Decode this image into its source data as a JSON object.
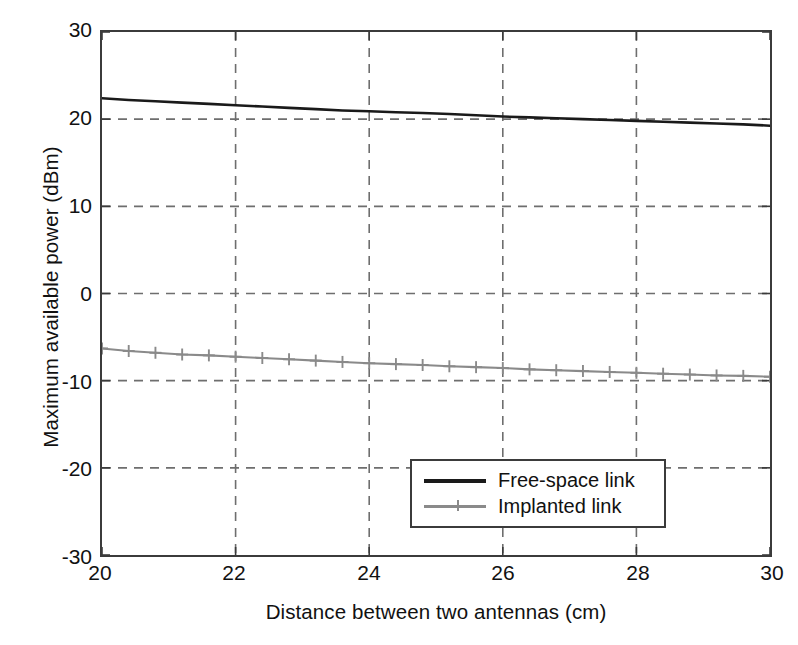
{
  "chart_data": {
    "type": "line",
    "title": "",
    "xlabel": "Distance between two antennas (cm)",
    "ylabel": "Maximum available power (dBm)",
    "xlim": [
      20,
      30
    ],
    "ylim": [
      -30,
      30
    ],
    "xticks": [
      20,
      22,
      24,
      26,
      28,
      30
    ],
    "yticks": [
      30,
      20,
      10,
      0,
      -10,
      -20,
      -30
    ],
    "xtick_labels": [
      "20",
      "22",
      "24",
      "26",
      "28",
      "30"
    ],
    "ytick_labels": [
      "30",
      "20",
      "10",
      "0",
      "-10",
      "-20",
      "-30"
    ],
    "grid": true,
    "grid_style": "dashed",
    "legend_position": "lower right",
    "x": [
      20.0,
      20.4,
      20.8,
      21.2,
      21.6,
      22.0,
      22.4,
      22.8,
      23.2,
      23.6,
      24.0,
      24.4,
      24.8,
      25.2,
      25.6,
      26.0,
      26.4,
      26.8,
      27.2,
      27.6,
      28.0,
      28.4,
      28.8,
      29.2,
      29.6,
      30.0
    ],
    "series": [
      {
        "name": "Free-space link",
        "color": "#1a1a1a",
        "marker": "none",
        "linestyle": "solid",
        "values": [
          22.4,
          22.2,
          22.05,
          21.9,
          21.75,
          21.6,
          21.45,
          21.3,
          21.15,
          21.0,
          20.9,
          20.8,
          20.7,
          20.6,
          20.45,
          20.3,
          20.2,
          20.1,
          20.0,
          19.9,
          19.8,
          19.7,
          19.6,
          19.5,
          19.4,
          19.25
        ]
      },
      {
        "name": "Implanted link",
        "color": "#8a8a8a",
        "marker": "plus",
        "linestyle": "solid",
        "values": [
          -6.3,
          -6.6,
          -6.8,
          -7.0,
          -7.1,
          -7.25,
          -7.4,
          -7.55,
          -7.7,
          -7.85,
          -8.0,
          -8.1,
          -8.2,
          -8.35,
          -8.45,
          -8.55,
          -8.7,
          -8.8,
          -8.9,
          -9.0,
          -9.1,
          -9.2,
          -9.3,
          -9.4,
          -9.45,
          -9.55
        ]
      }
    ]
  },
  "axes": {
    "ylabel": "Maximum available power (dBm)",
    "xlabel": "Distance between two antennas (cm)"
  },
  "legend": {
    "items": [
      {
        "label": "Free-space link"
      },
      {
        "label": "Implanted link"
      }
    ]
  }
}
